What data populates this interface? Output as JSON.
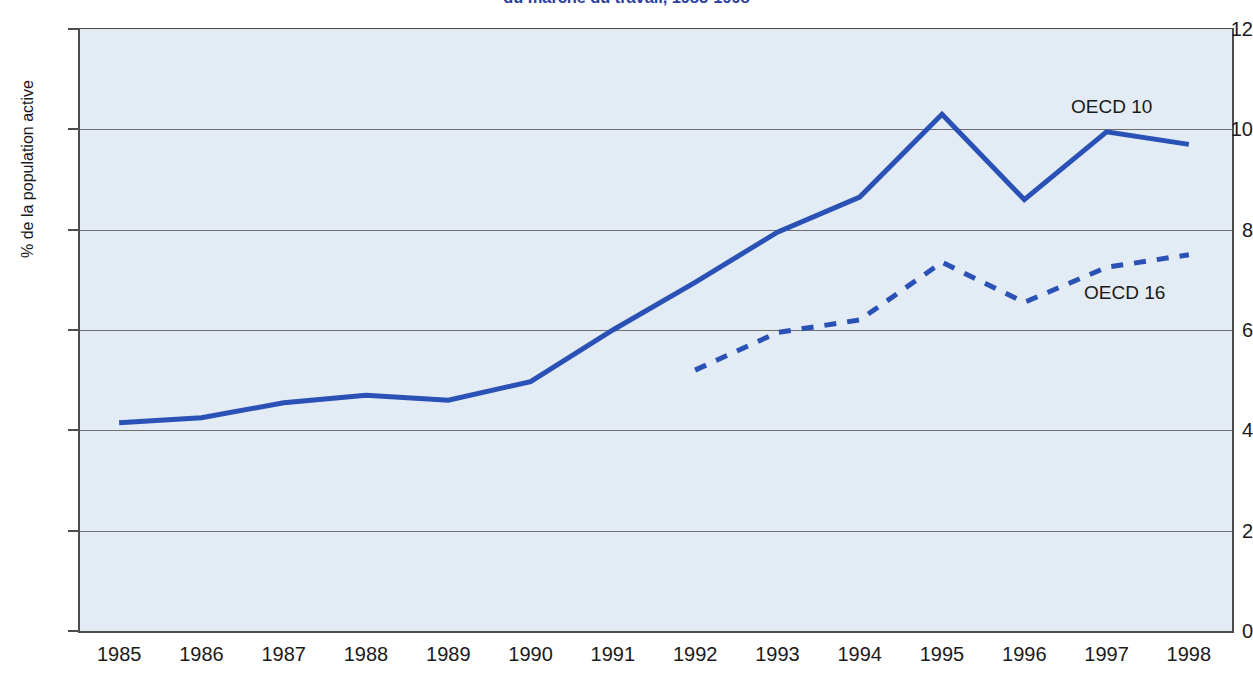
{
  "chart_data": {
    "type": "line",
    "title": "du marché du travail, 1985-1998",
    "xlabel": "",
    "ylabel": "% de la population active",
    "categories": [
      "1985",
      "1986",
      "1987",
      "1988",
      "1989",
      "1990",
      "1991",
      "1992",
      "1993",
      "1994",
      "1995",
      "1996",
      "1997",
      "1998"
    ],
    "ylim": [
      0,
      12
    ],
    "ytick_labels": [
      "12",
      "10",
      "8",
      "6",
      "4",
      "2",
      "0"
    ],
    "ytick_values": [
      12,
      10,
      8,
      6,
      4,
      2,
      0
    ],
    "grid": true,
    "legend_position": "inline-right",
    "series": [
      {
        "name": "OECD 10",
        "style": "solid",
        "color": "#2a51b5",
        "x": [
          "1985",
          "1986",
          "1987",
          "1988",
          "1989",
          "1990",
          "1991",
          "1992",
          "1993",
          "1994",
          "1995",
          "1996",
          "1997",
          "1998"
        ],
        "values": [
          4.15,
          4.25,
          4.55,
          4.7,
          4.6,
          4.97,
          6.0,
          6.95,
          7.95,
          8.65,
          10.3,
          8.6,
          9.95,
          9.7
        ]
      },
      {
        "name": "OECD 16",
        "style": "dashed",
        "color": "#2a51b5",
        "x": [
          "1992",
          "1993",
          "1994",
          "1995",
          "1996",
          "1997",
          "1998"
        ],
        "values": [
          5.2,
          5.95,
          6.2,
          7.35,
          6.55,
          7.25,
          7.5
        ]
      }
    ],
    "colors": {
      "line": "#2a51b5",
      "plot_background": "#e3ebf4",
      "axis": "#4d4d4d",
      "gridline": "#6f6f6f",
      "title": "#2b3f9e",
      "text": "#1a1a1a"
    }
  },
  "labels": {
    "series_oecd10": "OECD 10",
    "series_oecd16": "OECD 16"
  }
}
